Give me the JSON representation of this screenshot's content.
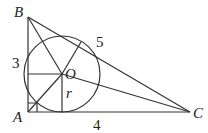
{
  "diagram": {
    "type": "geometry",
    "points": {
      "A": {
        "label": "A",
        "x": 28,
        "y": 112
      },
      "B": {
        "label": "B",
        "x": 28,
        "y": 17
      },
      "C": {
        "label": "C",
        "x": 190,
        "y": 112
      },
      "O": {
        "label": "O",
        "x": 62,
        "y": 74
      }
    },
    "side_labels": {
      "AB": "3",
      "BC": "5",
      "AC": "4"
    },
    "radius_label": "r",
    "circle": {
      "cx": 62,
      "cy": 74,
      "r": 38
    },
    "right_angle_marker": "A",
    "segments": [
      "AB",
      "BC",
      "CA",
      "OA",
      "OB",
      "OC",
      "O-to-AB",
      "O-to-AC",
      "O-to-BC"
    ]
  }
}
